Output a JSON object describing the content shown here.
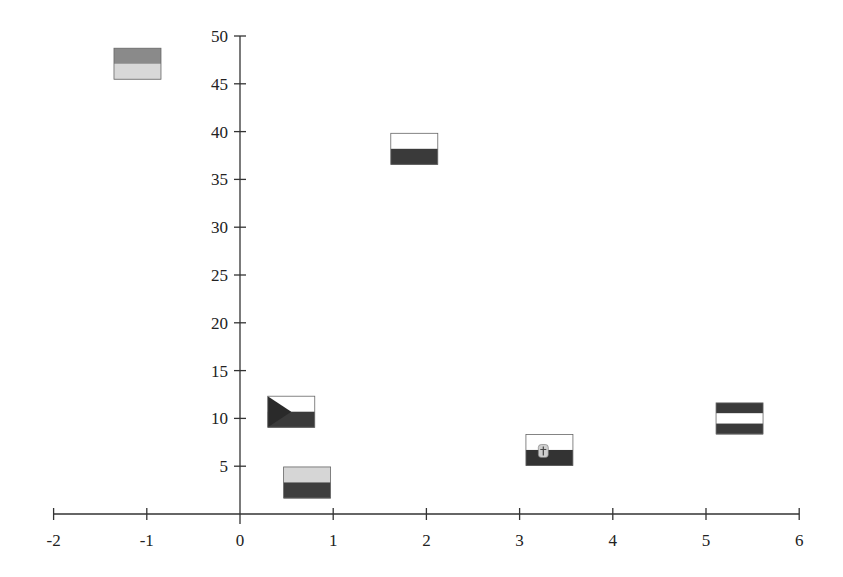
{
  "chart_data": {
    "type": "scatter",
    "title": "",
    "xlabel": "",
    "ylabel": "",
    "xlim": [
      -2,
      6
    ],
    "ylim": [
      0,
      50
    ],
    "grid": false,
    "legend": null,
    "x_ticks": [
      -2,
      -1,
      0,
      1,
      2,
      3,
      4,
      5,
      6
    ],
    "y_ticks": [
      5,
      10,
      15,
      20,
      25,
      30,
      35,
      40,
      45,
      50
    ],
    "marker": "country-flag images (grayscale)",
    "points": [
      {
        "x": -1.1,
        "y": 47.1,
        "marker": "flag-two-horizontal-bands-dark-over-light",
        "bands": [
          "#8a8a8a",
          "#d8d8d8"
        ]
      },
      {
        "x": 1.87,
        "y": 38.2,
        "marker": "flag-white-over-dark (Poland-like)",
        "bands": [
          "#ffffff",
          "#3a3a3a"
        ]
      },
      {
        "x": 0.55,
        "y": 10.7,
        "marker": "flag-czech-like (triangle at hoist)",
        "bands": [
          "#ffffff",
          "#3a3a3a"
        ],
        "triangle": "#2a2a2a"
      },
      {
        "x": 0.72,
        "y": 3.3,
        "marker": "flag-two-horizontal-bands-light-over-dark",
        "bands": [
          "#d6d6d6",
          "#3e3e3e"
        ]
      },
      {
        "x": 3.32,
        "y": 6.7,
        "marker": "flag-slovakia-like (white over dark with emblem)",
        "bands": [
          "#ffffff",
          "#333333"
        ],
        "emblem": "#cfcfcf"
      },
      {
        "x": 5.36,
        "y": 10.0,
        "marker": "flag-austria-like (dark-white-dark)",
        "bands": [
          "#3a3a3a",
          "#ffffff",
          "#3a3a3a"
        ]
      }
    ]
  },
  "axis": {
    "x_labels": [
      "-2",
      "-1",
      "0",
      "1",
      "2",
      "3",
      "4",
      "5",
      "6"
    ],
    "y_labels": [
      "5",
      "10",
      "15",
      "20",
      "25",
      "30",
      "35",
      "40",
      "45",
      "50"
    ]
  }
}
